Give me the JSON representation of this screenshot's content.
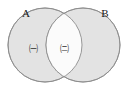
{
  "figure": {
    "type": "venn-diagram",
    "sets": [
      {
        "id": "A",
        "label": "A",
        "label_x": 26,
        "label_y": 17
      },
      {
        "id": "B",
        "label": "B",
        "label_x": 105,
        "label_y": 17
      }
    ],
    "regions": [
      {
        "id": "a-only",
        "label": "㈠",
        "label_x": 33,
        "label_y": 49,
        "shaded": true
      },
      {
        "id": "intersection",
        "label": "㈡",
        "label_x": 64,
        "label_y": 49,
        "shaded": false
      }
    ],
    "colors": {
      "shaded_fill": "#e3e3e3",
      "intersection_fill": "#fbfbfb",
      "outline": "#8d8d8d",
      "text": "#1a1a1a",
      "background": "#ffffff"
    },
    "geometry": {
      "left_circle": {
        "cx": 45,
        "cy": 45,
        "r": 37
      },
      "right_circle": {
        "cx": 83,
        "cy": 45,
        "r": 37
      }
    }
  }
}
